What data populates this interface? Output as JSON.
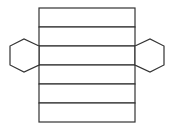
{
  "diagram": {
    "type": "net",
    "stroke_color": "#333333",
    "fill_color": "#ffffff",
    "lateral_faces": {
      "count": 6,
      "x": 39,
      "width": 96,
      "y_lines": [
        8,
        27,
        46,
        65,
        84,
        103,
        122
      ]
    },
    "bases": [
      {
        "name": "left-hexagon",
        "points": "39,46 24,39 10,46 10,65 24,72 39,65"
      },
      {
        "name": "right-hexagon",
        "points": "135,46 150,39 164,46 164,65 150,72 135,65"
      }
    ]
  }
}
